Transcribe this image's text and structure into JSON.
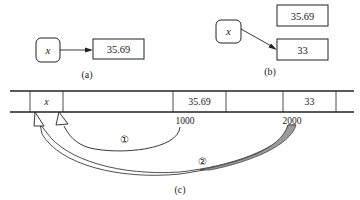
{
  "panel_a": {
    "variable": "x",
    "value": "35.69",
    "caption": "(a)"
  },
  "panel_b": {
    "variable": "x",
    "old_value": "35.69",
    "new_value": "33",
    "caption": "(b)"
  },
  "panel_c": {
    "cells": [
      {
        "content": "x"
      },
      {
        "content": "35.69"
      },
      {
        "content": "33"
      }
    ],
    "addresses": [
      "1000",
      "2000"
    ],
    "arrow_labels": [
      "①",
      "②"
    ],
    "caption": "(c)"
  },
  "colors": {
    "line": "#222222",
    "fill_gray": "#9a9a9a",
    "background": "#ffffff"
  }
}
